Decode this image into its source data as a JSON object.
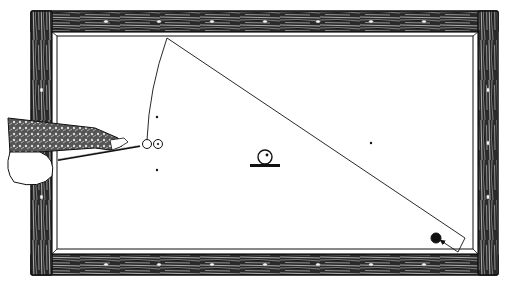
{
  "figure": {
    "type": "billiards-shot-diagram",
    "style": "vintage black-and-white line illustration",
    "colors": {
      "background": "#ffffff",
      "ink": "#111111",
      "rail_wood_dark": "#1a1a1a",
      "rail_wood_light": "#e8e8e8",
      "cloth": "#ffffff"
    }
  },
  "table": {
    "outer": {
      "x": 31,
      "y": 11,
      "w": 467,
      "h": 264
    },
    "cushion_line": {
      "x": 52,
      "y": 32,
      "w": 426,
      "h": 222
    },
    "playing_area": {
      "x": 57,
      "y": 36,
      "w": 416,
      "h": 213
    },
    "diamonds_top": [
      106,
      159,
      212,
      265,
      318,
      371,
      424
    ],
    "diamonds_bottom": [
      106,
      159,
      212,
      265,
      318,
      371,
      424
    ],
    "diamonds_right": [
      90,
      143,
      197
    ],
    "diamonds_left": [
      90,
      197
    ]
  },
  "spots": [
    {
      "name": "spot-upper",
      "x": 157,
      "y": 117
    },
    {
      "name": "spot-lower",
      "x": 157,
      "y": 170
    },
    {
      "name": "spot-right",
      "x": 371,
      "y": 143
    }
  ],
  "balls": [
    {
      "name": "cue-ball",
      "x": 147,
      "y": 144,
      "r": 4.5,
      "fill": "#ffffff",
      "dot": false
    },
    {
      "name": "object-ball-white-spot",
      "x": 158,
      "y": 144,
      "r": 4.5,
      "fill": "#ffffff",
      "dot": true
    },
    {
      "name": "red-ball-target",
      "x": 436,
      "y": 238,
      "r": 5,
      "fill": "#111111",
      "dot": false
    }
  ],
  "center_marker": {
    "x": 265,
    "y": 157,
    "r": 7,
    "base_w": 30
  },
  "shot_path": {
    "points": [
      [
        147,
        140
      ],
      [
        167,
        38
      ],
      [
        465,
        238
      ],
      [
        458,
        252
      ],
      [
        440,
        240
      ]
    ],
    "curve_first_leg": true,
    "arrow_at_end": true
  },
  "player": {
    "description": "arm with patterned sleeve holding cue from left",
    "cue_from": [
      58,
      160
    ],
    "cue_to": [
      140,
      146
    ]
  }
}
